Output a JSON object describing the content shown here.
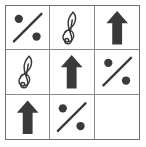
{
  "figure": {
    "type": "3x3-symbol-matrix",
    "rows": 3,
    "columns": 3,
    "background_color": "#ffffff",
    "border_color": "#6e6e72",
    "grid_line_color": "#8a8a8e",
    "symbol_color": "#3a3a3a",
    "symbols": {
      "percent": "percent-sign",
      "treble_clef": "treble-clef",
      "up_arrow": "up-arrow",
      "blank": "empty"
    },
    "cells": [
      {
        "row": 1,
        "col": 1,
        "symbol": "percent",
        "label": "percent sign"
      },
      {
        "row": 1,
        "col": 2,
        "symbol": "treble_clef",
        "label": "treble clef"
      },
      {
        "row": 1,
        "col": 3,
        "symbol": "up_arrow",
        "label": "up arrow"
      },
      {
        "row": 2,
        "col": 1,
        "symbol": "treble_clef",
        "label": "treble clef"
      },
      {
        "row": 2,
        "col": 2,
        "symbol": "up_arrow",
        "label": "up arrow"
      },
      {
        "row": 2,
        "col": 3,
        "symbol": "percent",
        "label": "percent sign"
      },
      {
        "row": 3,
        "col": 1,
        "symbol": "up_arrow",
        "label": "up arrow"
      },
      {
        "row": 3,
        "col": 2,
        "symbol": "percent",
        "label": "percent sign"
      },
      {
        "row": 3,
        "col": 3,
        "symbol": "blank",
        "label": ""
      }
    ]
  }
}
